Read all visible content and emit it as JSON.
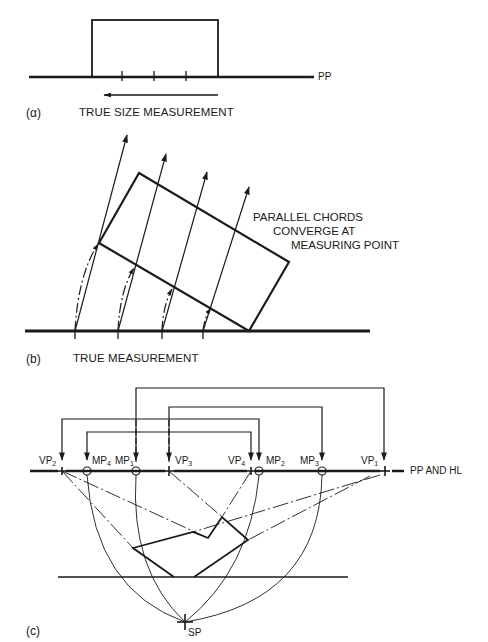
{
  "panels": {
    "a": {
      "label": "(α)",
      "plane_label": "PP",
      "caption": "TRUE SIZE MEASUREMENT"
    },
    "b": {
      "label": "(b)",
      "caption": "TRUE MEASUREMENT",
      "annotation_lines": [
        "PARALLEL CHORDS",
        "CONVERGE AT",
        "MEASURING POINT"
      ]
    },
    "c": {
      "label": "(c)",
      "line_label": "PP AND HL",
      "station_point": "SP",
      "points": [
        {
          "name": "VP",
          "sub": "2"
        },
        {
          "name": "MP",
          "sub": "4"
        },
        {
          "name": "MP",
          "sub": "1"
        },
        {
          "name": "VP",
          "sub": "3"
        },
        {
          "name": "VP",
          "sub": "4"
        },
        {
          "name": "MP",
          "sub": "2"
        },
        {
          "name": "MP",
          "sub": "3"
        },
        {
          "name": "VP",
          "sub": "1"
        }
      ]
    }
  },
  "colors": {
    "ink": "#1a1a1a",
    "background": "#ffffff"
  }
}
